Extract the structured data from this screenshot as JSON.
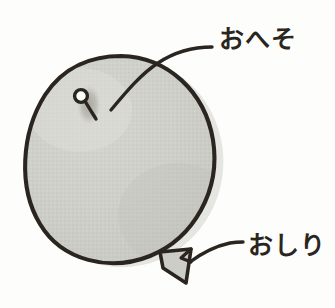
{
  "figure": {
    "type": "illustration-diagram",
    "background_color": "#fdfdfc",
    "ink_color": "#2b2520",
    "fill_color": "#cdcdc8",
    "shadow_color": "#e2e2de",
    "navel_shadow_color": "#a9a9a3"
  },
  "labels": {
    "navel": {
      "text": "おへそ",
      "meaning": "navel",
      "anchor": "balloon-navel"
    },
    "bottom": {
      "text": "おしり",
      "meaning": "bottom",
      "anchor": "balloon-nozzle"
    }
  },
  "parts": {
    "body_name": "balloon-body",
    "navel_name": "balloon-navel",
    "nozzle_name": "balloon-nozzle",
    "leader_top_name": "leader-line-navel",
    "leader_bottom_name": "leader-line-bottom"
  }
}
